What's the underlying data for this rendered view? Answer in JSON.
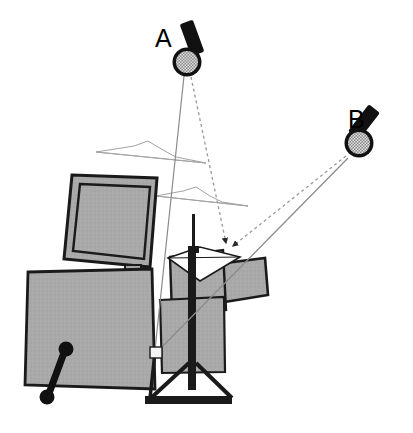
{
  "figure": {
    "background_color": "#ffffff",
    "width": 413,
    "height": 433
  },
  "palette": {
    "panel_fill": "#a9a9a9",
    "panel_fill_dark": "#9e9e9e",
    "outline": "#1a1a1a",
    "mic_ring": "#111111",
    "mic_mesh_light": "#d8d8d8",
    "mic_mesh_dark": "#4a4a4a",
    "sample_fill": "#ffffff",
    "beam_solid": "#7a7a7a",
    "beam_dashed": "#8c8c8c",
    "waveform": "#9a9a9a",
    "node_fill": "#f2f2f2"
  },
  "labels": {
    "mic_a": "A",
    "mic_b": "B"
  },
  "microphones": [
    {
      "id": "A",
      "label": "A",
      "head_center": [
        187,
        62
      ],
      "head_radius": 14,
      "label_pos": [
        161,
        47
      ],
      "body_angle_deg": -20
    },
    {
      "id": "B",
      "label": "B",
      "head_center": [
        359,
        143
      ],
      "head_radius": 14,
      "label_pos": [
        354,
        124
      ],
      "body_angle_deg": -35
    }
  ],
  "beams": {
    "convergence_point": [
      228,
      252
    ],
    "node_point": [
      155,
      352
    ],
    "dashed_from_a": {
      "from": [
        190,
        76
      ],
      "to": [
        228,
        250
      ]
    },
    "dashed_from_b": {
      "from": [
        347,
        155
      ],
      "to": [
        232,
        250
      ]
    },
    "solid_from_a": {
      "from": [
        184,
        76
      ],
      "to": [
        155,
        350
      ]
    },
    "solid_from_b": {
      "from": [
        348,
        158
      ],
      "to": [
        157,
        352
      ]
    },
    "arrowhead_at": [
      228,
      250
    ]
  },
  "waveforms": [
    {
      "id": "waveform-upper",
      "peak": [
        148,
        141
      ],
      "baseline_left": [
        96,
        152
      ],
      "baseline_right": [
        206,
        163
      ]
    },
    {
      "id": "waveform-lower",
      "peak": [
        196,
        187
      ],
      "baseline_left": [
        156,
        196
      ],
      "baseline_right": [
        248,
        206
      ]
    }
  ],
  "objects": [
    {
      "id": "monitor-panel",
      "name": "tilted-monitor-panel"
    },
    {
      "id": "large-left-panel",
      "name": "large-left-panel"
    },
    {
      "id": "right-panel",
      "name": "tilted-right-panel"
    },
    {
      "id": "center-box",
      "name": "center-stage-box"
    },
    {
      "id": "sample-diamond",
      "name": "white-diamond-sample"
    },
    {
      "id": "tripod-stand",
      "name": "tripod-stand"
    },
    {
      "id": "handle",
      "name": "dumbbell-handle"
    },
    {
      "id": "post",
      "name": "vertical-post"
    },
    {
      "id": "node-marker",
      "name": "white-square-node"
    }
  ]
}
